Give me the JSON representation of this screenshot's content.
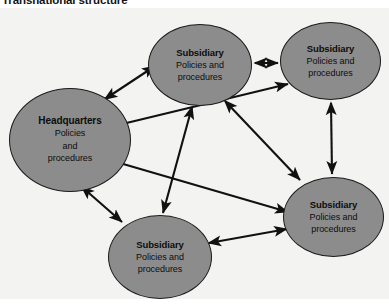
{
  "title": "Transnational structure",
  "colors": {
    "node_fill": "#8c8c8c",
    "node_stroke": "#1b1b1b",
    "arrow": "#111111",
    "panel_background": "#f3f3f2",
    "page_background": "#ffffff",
    "text": "#0d0d0d"
  },
  "nodes": [
    {
      "id": "headquarters",
      "heading": "Headquarters",
      "lines": [
        "Policies",
        "and",
        "procedures"
      ]
    },
    {
      "id": "subsidiary-top",
      "heading": "Subsidiary",
      "lines": [
        "Policies and",
        "procedures"
      ]
    },
    {
      "id": "subsidiary-top-right",
      "heading": "Subsidiary",
      "lines": [
        "Policies and",
        "procedures"
      ]
    },
    {
      "id": "subsidiary-right",
      "heading": "Subsidiary",
      "lines": [
        "Policies and",
        "procedures"
      ]
    },
    {
      "id": "subsidiary-bottom",
      "heading": "Subsidiary",
      "lines": [
        "Policies and",
        "procedures"
      ]
    }
  ],
  "connections": [
    {
      "from": "headquarters",
      "to": "subsidiary-top",
      "style": "double-arrow"
    },
    {
      "from": "headquarters",
      "to": "subsidiary-bottom",
      "style": "double-arrow"
    },
    {
      "from": "headquarters",
      "to": "subsidiary-right",
      "style": "double-arrow"
    },
    {
      "from": "headquarters",
      "to": "subsidiary-top-right",
      "style": "double-arrow"
    },
    {
      "from": "subsidiary-top",
      "to": "subsidiary-top-right",
      "style": "double-arrow"
    },
    {
      "from": "subsidiary-top-right",
      "to": "subsidiary-right",
      "style": "double-arrow"
    },
    {
      "from": "subsidiary-top",
      "to": "subsidiary-bottom",
      "style": "double-arrow"
    },
    {
      "from": "subsidiary-bottom",
      "to": "subsidiary-right",
      "style": "double-arrow"
    },
    {
      "from": "subsidiary-top",
      "to": "subsidiary-right",
      "style": "double-arrow"
    }
  ]
}
